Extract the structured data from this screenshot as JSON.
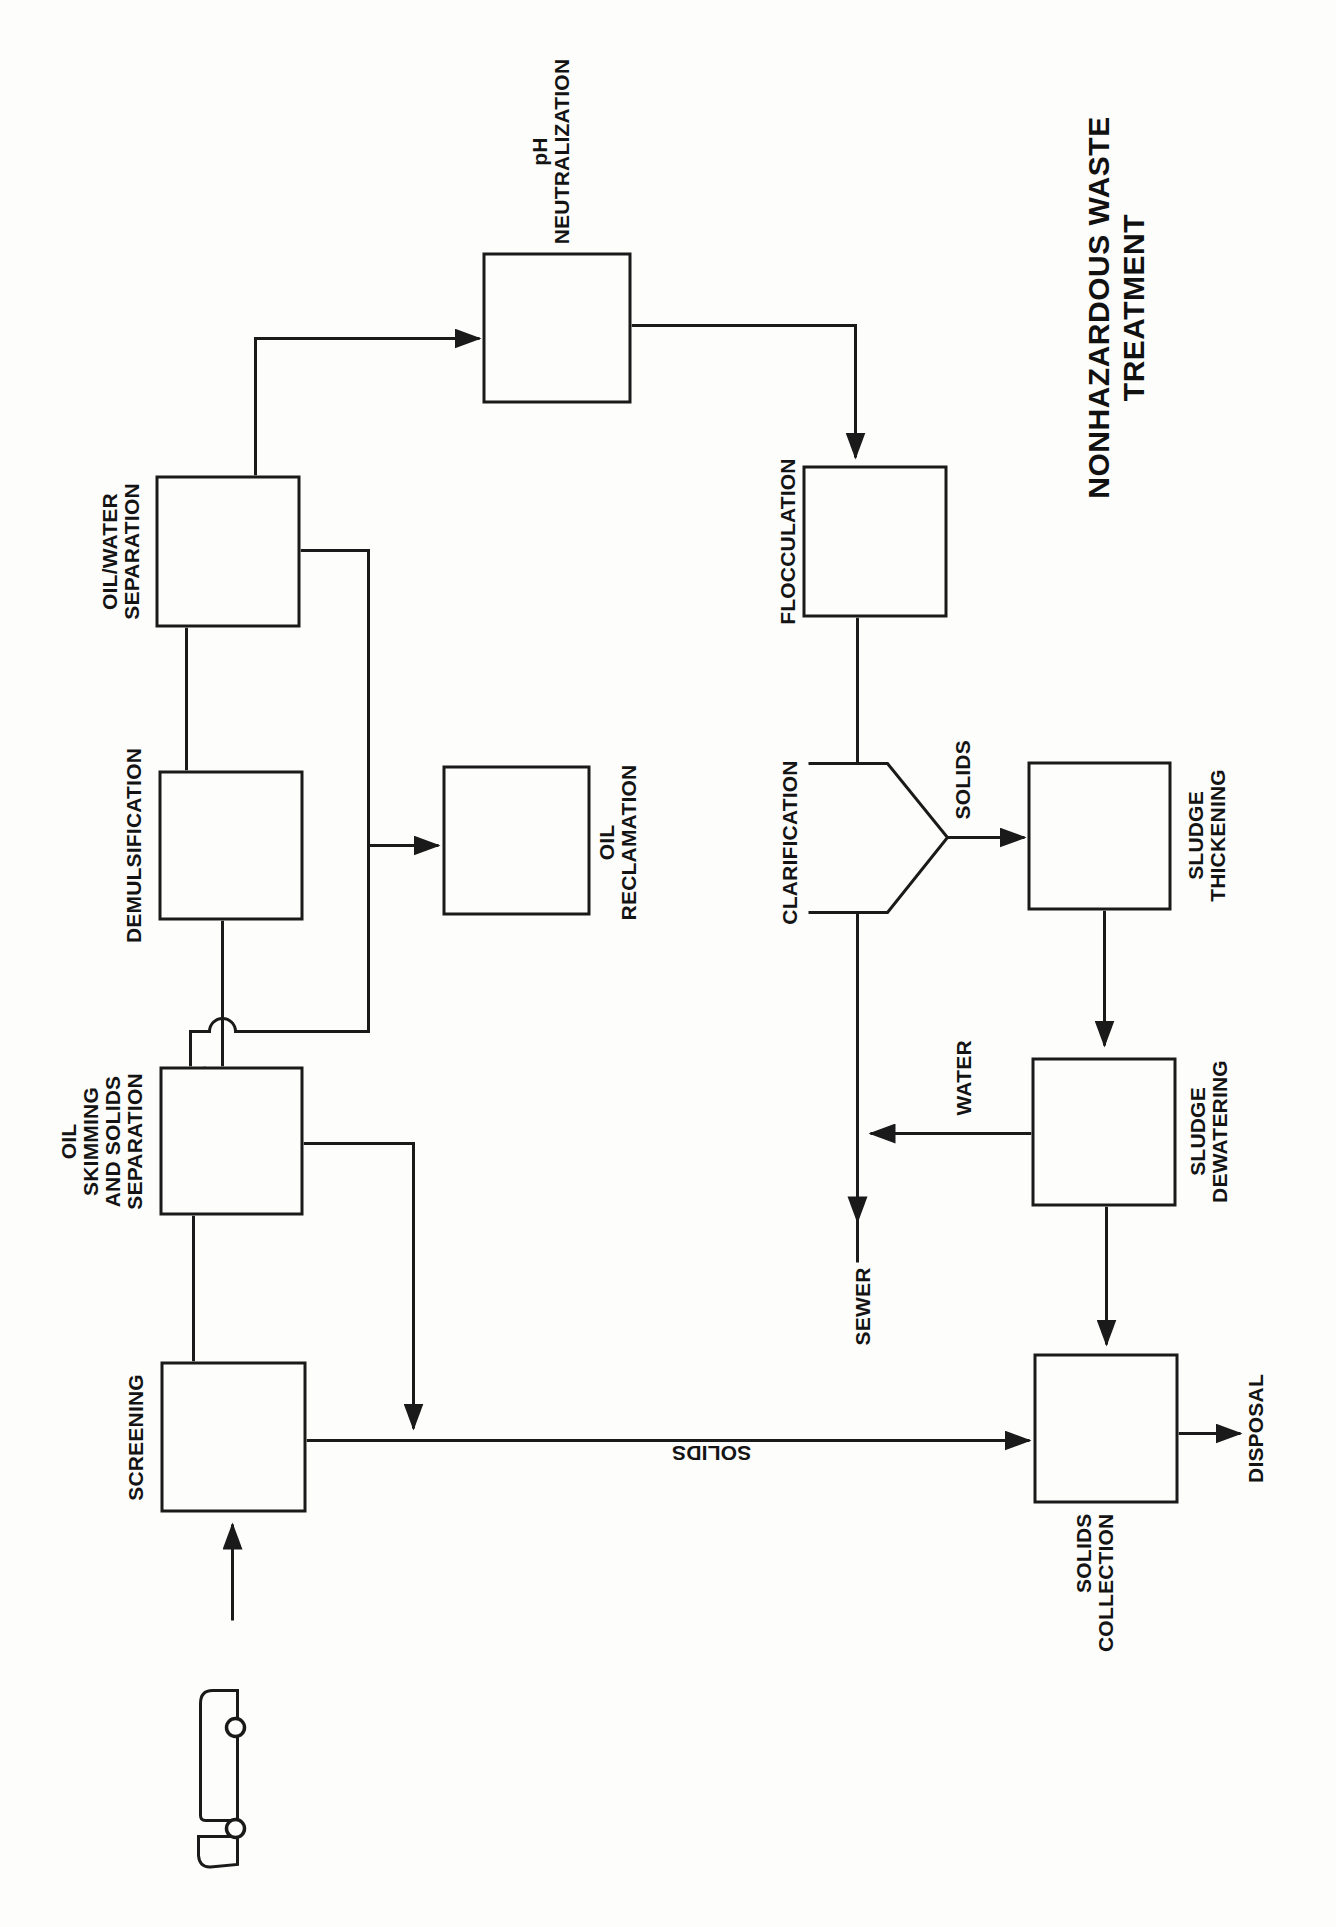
{
  "title": {
    "text": "NONHAZARDOUS WASTE\nTREATMENT"
  },
  "nodes": {
    "screening": {
      "label": "SCREENING"
    },
    "oil_skimming": {
      "label": "OIL\nSKIMMING\nAND SOLIDS\nSEPARATION"
    },
    "demulsification": {
      "label": "DEMULSIFICATION"
    },
    "oil_water_sep": {
      "label": "OIL/WATER\nSEPARATION"
    },
    "ph_neutralization": {
      "label": "pH\nNEUTRALIZATION"
    },
    "flocculation": {
      "label": "FLOCCULATION"
    },
    "clarification": {
      "label": "CLARIFICATION"
    },
    "oil_reclamation": {
      "label": "OIL\nRECLAMATION"
    },
    "sludge_thickening": {
      "label": "SLUDGE\nTHICKENING"
    },
    "sludge_dewatering": {
      "label": "SLUDGE\nDEWATERING"
    },
    "solids_collection": {
      "label": "SOLIDS\nCOLLECTION"
    }
  },
  "flow_labels": {
    "solids_from_clarifier": "SOLIDS",
    "solids_from_screening": "SOLIDS",
    "water": "WATER",
    "sewer": "SEWER",
    "disposal": "DISPOSAL"
  },
  "colors": {
    "ink": "#1a1a1a",
    "paper": "#fdfdfc"
  }
}
